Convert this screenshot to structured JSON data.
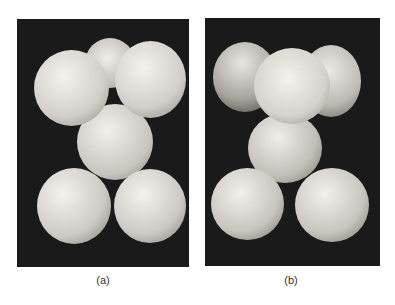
{
  "figure": {
    "panels": [
      {
        "id": "a",
        "label": "(a)",
        "description": "Six white spheres stacked: two front-top, one rear-top, one middle, two bottom, on black background"
      },
      {
        "id": "b",
        "label": "(b)",
        "description": "Same sphere arrangement viewed from a rotated angle: one front-top with two behind, one middle, two bottom"
      }
    ],
    "colors": {
      "background": "#1a1a1a",
      "sphere": "#e8e6e2",
      "page": "#ffffff"
    }
  }
}
